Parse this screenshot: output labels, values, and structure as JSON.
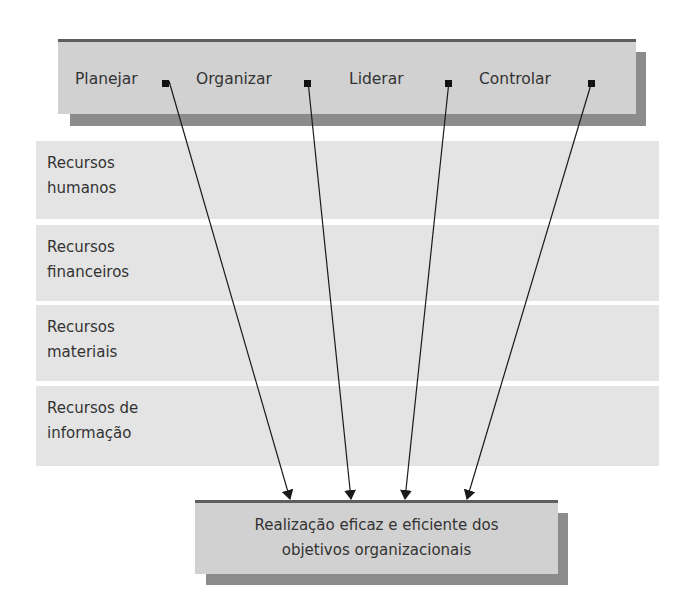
{
  "diagram": {
    "functions": [
      {
        "label": "Planejar",
        "marker_x": 166
      },
      {
        "label": "Organizar",
        "marker_x": 308
      },
      {
        "label": "Liderar",
        "marker_x": 449
      },
      {
        "label": "Controlar",
        "marker_x": 592
      }
    ],
    "resources": [
      {
        "label": "Recursos\nhumanos"
      },
      {
        "label": "Recursos\nfinanceiros"
      },
      {
        "label": "Recursos\nmateriais"
      },
      {
        "label": "Recursos de\ninformação"
      }
    ],
    "goal": {
      "line1": "Realização eficaz e eficiente dos",
      "line2": "objetivos organizacionais"
    },
    "arrows": [
      {
        "from": "Planejar",
        "to": "goal"
      },
      {
        "from": "Organizar",
        "to": "goal"
      },
      {
        "from": "Liderar",
        "to": "goal"
      },
      {
        "from": "Controlar",
        "to": "goal"
      }
    ],
    "colors": {
      "box_fill": "#d1d1d1",
      "box_border": "#5e5e5e",
      "shadow": "#8c8c8c",
      "band_fill": "#e4e4e4",
      "arrow": "#1a1a1a"
    }
  }
}
